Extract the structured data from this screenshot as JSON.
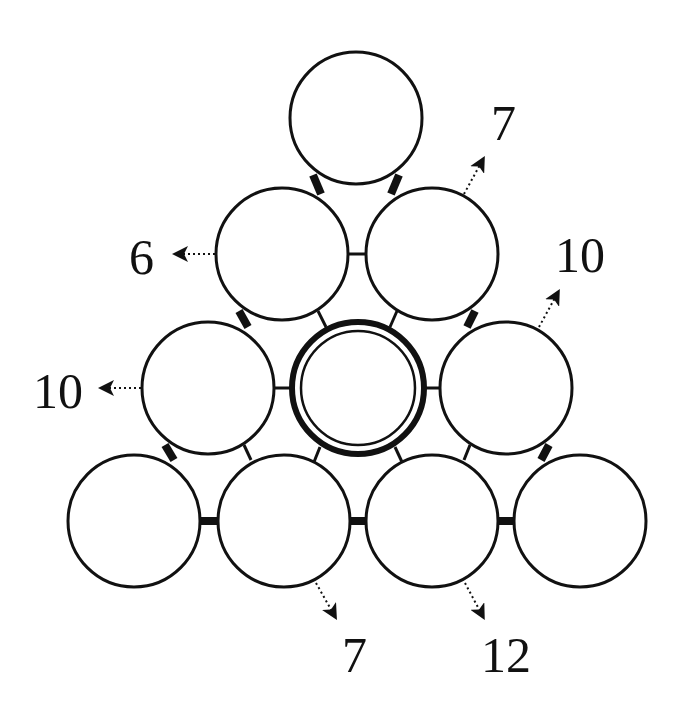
{
  "puzzle": {
    "type": "number-triangle-circles",
    "rows": [
      1,
      2,
      3,
      4
    ],
    "circles": [
      {
        "id": "r1c1",
        "cx": 356,
        "cy": 118,
        "value": ""
      },
      {
        "id": "r2c1",
        "cx": 282,
        "cy": 254,
        "value": ""
      },
      {
        "id": "r2c2",
        "cx": 432,
        "cy": 254,
        "value": ""
      },
      {
        "id": "r3c1",
        "cx": 208,
        "cy": 388,
        "value": ""
      },
      {
        "id": "r3c2",
        "cx": 358,
        "cy": 388,
        "value": "",
        "highlighted": true
      },
      {
        "id": "r3c3",
        "cx": 506,
        "cy": 388,
        "value": ""
      },
      {
        "id": "r4c1",
        "cx": 134,
        "cy": 521,
        "value": ""
      },
      {
        "id": "r4c2",
        "cx": 284,
        "cy": 521,
        "value": ""
      },
      {
        "id": "r4c3",
        "cx": 432,
        "cy": 521,
        "value": ""
      },
      {
        "id": "r4c4",
        "cx": 580,
        "cy": 521,
        "value": ""
      }
    ],
    "clues": {
      "left_row2": "6",
      "left_row3": "10",
      "right_row2": "7",
      "right_row3": "10",
      "bottom_left": "7",
      "bottom_right": "12"
    }
  }
}
